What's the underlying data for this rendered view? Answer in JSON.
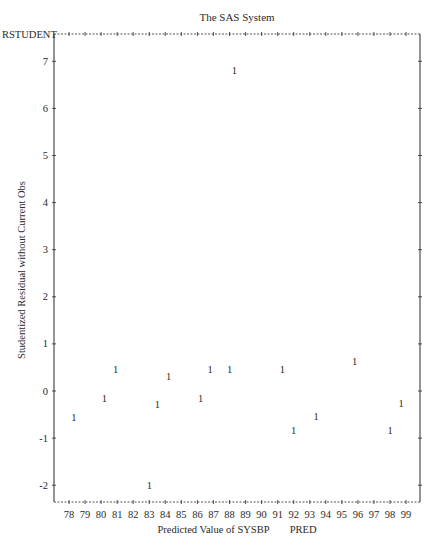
{
  "chart_data": {
    "type": "scatter",
    "title": "The SAS System",
    "xlabel": "Predicted Value of SYSBP",
    "xlabel_suffix": "PRED",
    "ylabel": "Studentized Residual without Current Obs",
    "ylabel_top": "RSTUDENT",
    "plot_symbol": "1",
    "xlim": [
      78,
      99
    ],
    "ylim": [
      -2,
      7
    ],
    "x_ticks": [
      78,
      79,
      80,
      81,
      82,
      83,
      84,
      85,
      86,
      87,
      88,
      89,
      90,
      91,
      92,
      93,
      94,
      95,
      96,
      97,
      98,
      99
    ],
    "y_ticks": [
      -2,
      -1,
      0,
      1,
      2,
      3,
      4,
      5,
      6,
      7
    ],
    "grid": false,
    "legend": null,
    "points": [
      {
        "x": 78.3,
        "y": -0.57
      },
      {
        "x": 80.2,
        "y": -0.15
      },
      {
        "x": 80.9,
        "y": 0.45
      },
      {
        "x": 83.0,
        "y": -2.0
      },
      {
        "x": 83.5,
        "y": -0.28
      },
      {
        "x": 84.2,
        "y": 0.3
      },
      {
        "x": 86.2,
        "y": -0.15
      },
      {
        "x": 86.8,
        "y": 0.45
      },
      {
        "x": 88.0,
        "y": 0.45
      },
      {
        "x": 88.3,
        "y": 6.81
      },
      {
        "x": 91.3,
        "y": 0.45
      },
      {
        "x": 92.0,
        "y": -0.83
      },
      {
        "x": 93.4,
        "y": -0.55
      },
      {
        "x": 95.8,
        "y": 0.62
      },
      {
        "x": 98.0,
        "y": -0.83
      },
      {
        "x": 98.7,
        "y": -0.26
      }
    ]
  },
  "colors": {
    "ink": "#2a2a2a",
    "background": "#ffffff"
  }
}
